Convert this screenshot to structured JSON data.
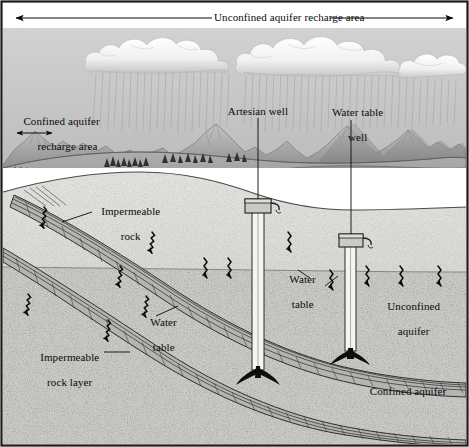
{
  "figure": {
    "width": 469,
    "height": 447
  },
  "labels": {
    "unconfined_recharge": "Unconfined aquifer recharge area",
    "confined_recharge_line1": "Confined aquifer",
    "confined_recharge_line2": "recharge area",
    "artesian_well": "Artesian well",
    "water_table_well_line1": "Water table",
    "water_table_well_line2": "well",
    "impermeable_rock_line1": "Impermeable",
    "impermeable_rock_line2": "rock",
    "water_table_left_line1": "Water",
    "water_table_left_line2": "table",
    "impermeable_rock_layer_line1": "Impermeable",
    "impermeable_rock_layer_line2": "rock layer",
    "water_table_center_line1": "Water",
    "water_table_center_line2": "table",
    "water_table_right_line1": "Water",
    "water_table_right_line2": "table",
    "unconfined_aquifer_line1": "Unconfined",
    "unconfined_aquifer_line2": "aquifer",
    "confined_aquifer": "Confined aquifer"
  },
  "colors": {
    "ink": "#0a0a0a",
    "sky": "#c9c9c9",
    "cloud_light": "#fdfdfd",
    "cloud_shadow": "#bdbdbd",
    "mountain_light": "#b5b5b5",
    "mountain_dark": "#8a8a8a",
    "valley": "#a0a0a0",
    "lake": "#909090",
    "unsaturated_zone": "#dcdcd8",
    "saturated_zone": "#c2c2be",
    "deep_sediment": "#cfcfcb",
    "rock_layer": "#b0b0ac",
    "well_casing": "#f2f2f0",
    "frame": "#1a1a1a"
  },
  "annotations": {
    "span_arrow_top": "double-headed horizontal arrow spanning full width",
    "span_arrow_confined": "short double-headed arrow under confined recharge label",
    "flow_arrows_diagonal": "squiggly arrows angled down-right within confined aquifer recharge path",
    "flow_arrows_vertical": "squiggly vertical arrows showing infiltration into unconfined aquifer",
    "rain_streaks": "vertical hatching beneath both cloud masses"
  }
}
